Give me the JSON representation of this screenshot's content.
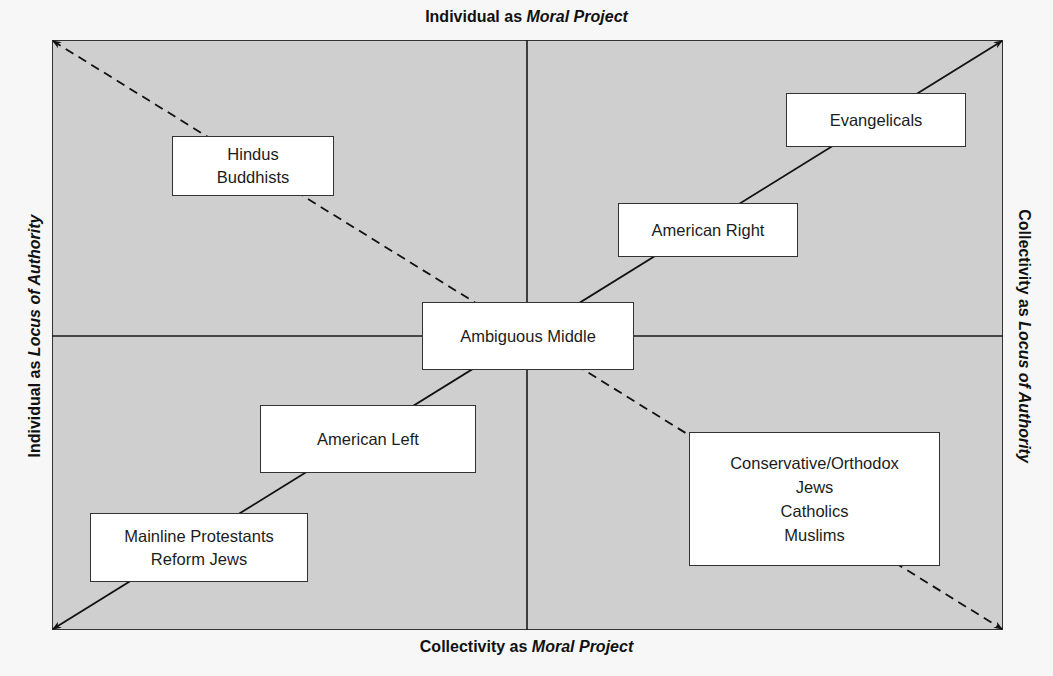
{
  "axes": {
    "top": {
      "prefix": "Individual as ",
      "emphasis": "Moral Project"
    },
    "bottom": {
      "prefix": "Collectivity as ",
      "emphasis": "Moral Project"
    },
    "left": {
      "prefix": "Individual as ",
      "emphasis": "Locus of Authority"
    },
    "right": {
      "prefix": "Collectivity as ",
      "emphasis": "Locus of Authority"
    }
  },
  "colors": {
    "plot_background": "#cfcfcf",
    "box_background": "#ffffff",
    "line": "#1a1a1a"
  },
  "boxes": {
    "hindus_buddhists": {
      "lines": [
        "Hindus",
        "Buddhists"
      ]
    },
    "evangelicals": {
      "lines": [
        "Evangelicals"
      ]
    },
    "american_right": {
      "lines": [
        "American Right"
      ]
    },
    "ambiguous_middle": {
      "lines": [
        "Ambiguous Middle"
      ]
    },
    "american_left": {
      "lines": [
        "American Left"
      ]
    },
    "mainline_reform": {
      "lines": [
        "Mainline Protestants",
        "Reform Jews"
      ]
    },
    "conservative_orthodox": {
      "lines": [
        "Conservative/Orthodox",
        "Jews",
        "Catholics",
        "Muslims"
      ]
    }
  },
  "diagonals": {
    "solid": {
      "from": "bottom-left",
      "to": "top-right",
      "style": "solid",
      "arrowheads": "both ends"
    },
    "dashed": {
      "from": "top-left",
      "to": "bottom-right",
      "style": "dashed",
      "arrowheads": "both ends"
    }
  }
}
